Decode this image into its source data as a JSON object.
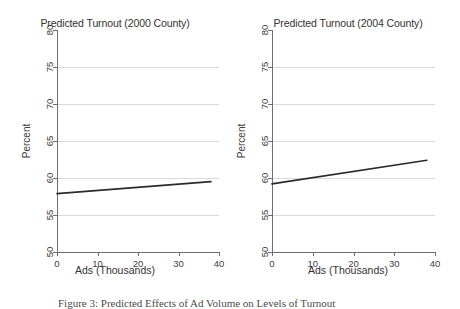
{
  "figure": {
    "caption": "Figure 3: Predicted Effects of Ad Volume on Levels of Turnout"
  },
  "panels": [
    {
      "key": "left",
      "title": "Predicted Turnout (2000 County)",
      "xlabel": "Ads (Thousands)",
      "ylabel": "Percent"
    },
    {
      "key": "right",
      "title": "Predicted Turnout (2004 County)",
      "xlabel": "Ads (Thousands)",
      "ylabel": "Percent"
    }
  ],
  "chart_data": [
    {
      "type": "line",
      "title": "Predicted Turnout (2000 County)",
      "xlabel": "Ads (Thousands)",
      "ylabel": "Percent",
      "xlim": [
        0,
        40
      ],
      "ylim": [
        50,
        80
      ],
      "xticks": [
        0,
        10,
        20,
        30,
        40
      ],
      "yticks": [
        50,
        55,
        60,
        65,
        70,
        75,
        80
      ],
      "grid": "horizontal",
      "legend": "none",
      "series": [
        {
          "name": "Predicted turnout 2000",
          "x": [
            0,
            38
          ],
          "values": [
            57.9,
            59.5
          ]
        }
      ]
    },
    {
      "type": "line",
      "title": "Predicted Turnout (2004 County)",
      "xlabel": "Ads (Thousands)",
      "ylabel": "Percent",
      "xlim": [
        0,
        40
      ],
      "ylim": [
        50,
        80
      ],
      "xticks": [
        0,
        10,
        20,
        30,
        40
      ],
      "yticks": [
        50,
        55,
        60,
        65,
        70,
        75,
        80
      ],
      "grid": "horizontal",
      "legend": "none",
      "series": [
        {
          "name": "Predicted turnout 2004",
          "x": [
            0,
            38
          ],
          "values": [
            59.2,
            62.4
          ]
        }
      ]
    }
  ],
  "colors": {
    "line": "#2b2b2b",
    "grid": "#d9d9d9",
    "axis": "#6e6e6e",
    "text": "#3d3d3d",
    "background": "#ffffff"
  }
}
